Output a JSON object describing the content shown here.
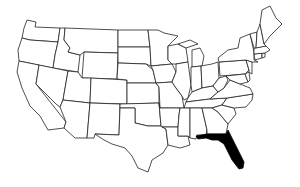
{
  "map": {
    "title": "United States",
    "highlighted_state": "Florida",
    "highlight_color": "#000000",
    "outline_color": "#222222",
    "background": "#ffffff"
  }
}
